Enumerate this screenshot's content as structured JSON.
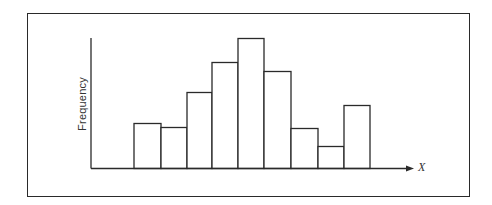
{
  "chart_data": {
    "type": "bar",
    "subtype": "histogram",
    "title": "",
    "xlabel": "X",
    "ylabel": "Frequency",
    "categories": [
      "bin1",
      "bin2",
      "bin3",
      "bin4",
      "bin5",
      "bin6",
      "bin7",
      "bin8",
      "bin9"
    ],
    "values": [
      45,
      41,
      76,
      106,
      130,
      97,
      40,
      22,
      63
    ],
    "value_units": "relative height (px, no numeric axis shown)",
    "x_ticks": [],
    "y_ticks": [],
    "grid": false,
    "legend": null,
    "x_axis_arrow": true
  },
  "colors": {
    "line": "#2a2a2a",
    "bar_fill": "#ffffff",
    "background": "#ffffff"
  }
}
